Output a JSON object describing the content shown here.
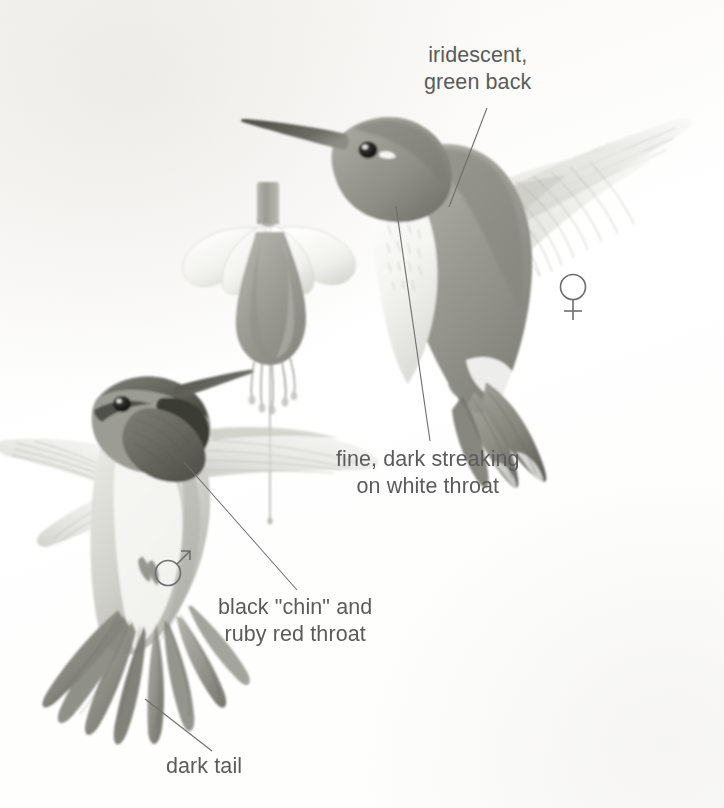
{
  "plate": {
    "subject": "Ruby-throated Hummingbird",
    "background_color": "#fefefd",
    "text_color": "#5b5b5b",
    "width": 724,
    "height": 808
  },
  "labels": {
    "iridescent_green_back": "iridescent,\ngreen back",
    "fine_dark_streaking": "fine, dark streaking\non white throat",
    "black_chin_ruby_throat": "black \"chin\" and\nruby red throat",
    "dark_tail": "dark tail"
  },
  "symbols": {
    "female": "♀",
    "male": "♂"
  },
  "figures": {
    "female_bird": "female-hummingbird-hovering",
    "male_bird": "male-hummingbird-feeding",
    "flower": "fuchsia-flower"
  },
  "leader_lines": [
    {
      "name": "leader-iridescent-green-back",
      "from": [
        487,
        108
      ],
      "to": [
        449,
        207
      ]
    },
    {
      "name": "leader-fine-dark-streaking",
      "from": [
        396,
        206
      ],
      "to": [
        430,
        441
      ]
    },
    {
      "name": "leader-black-chin",
      "from": [
        184,
        462
      ],
      "to": [
        297,
        590
      ]
    },
    {
      "name": "leader-dark-tail",
      "from": [
        145,
        699
      ],
      "to": [
        212,
        751
      ]
    }
  ]
}
